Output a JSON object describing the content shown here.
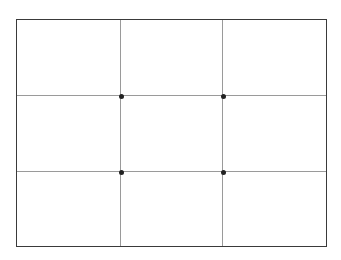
{
  "diagram": {
    "type": "rule-of-thirds-grid",
    "frame": {
      "border_color": "#3a3a3a",
      "background": "#ffffff"
    },
    "grid": {
      "columns": 3,
      "rows": 3,
      "line_color": "#9a9a9a"
    },
    "intersections": [
      {
        "label": "top-left",
        "col": 1,
        "row": 1
      },
      {
        "label": "top-right",
        "col": 2,
        "row": 1
      },
      {
        "label": "bottom-left",
        "col": 1,
        "row": 2
      },
      {
        "label": "bottom-right",
        "col": 2,
        "row": 2
      }
    ],
    "dot_color": "#222222"
  }
}
